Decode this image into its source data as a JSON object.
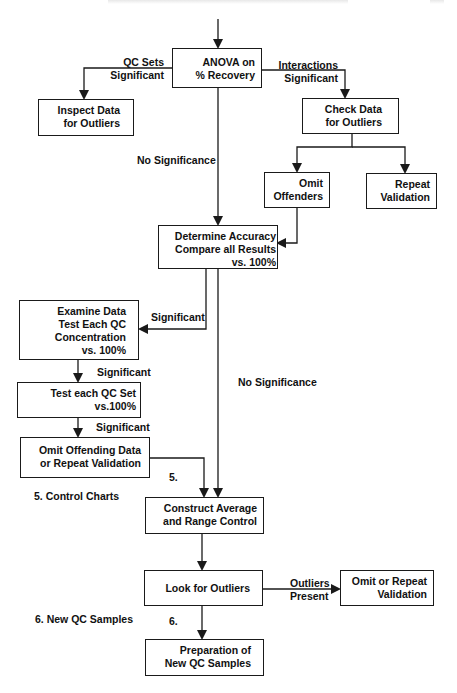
{
  "diagram": {
    "type": "flowchart",
    "nodes": {
      "anova": {
        "lines": [
          "ANOVA on",
          "% Recovery"
        ]
      },
      "inspect": {
        "lines": [
          "Inspect Data",
          "for Outliers"
        ]
      },
      "check": {
        "lines": [
          "Check Data",
          "for Outliers"
        ]
      },
      "omit_offenders": {
        "lines": [
          "Omit",
          "Offenders"
        ]
      },
      "repeat_validation": {
        "lines": [
          "Repeat",
          "Validation"
        ]
      },
      "determine": {
        "lines": [
          "Determine Accuracy",
          "Compare all Results",
          "vs. 100%"
        ]
      },
      "examine": {
        "lines": [
          "Examine Data",
          "Test Each QC",
          "Concentration",
          "vs. 100%"
        ]
      },
      "test_set": {
        "lines": [
          "Test each QC Set",
          "vs.100%"
        ]
      },
      "omit_offending": {
        "lines": [
          "Omit Offending Data",
          "or Repeat Validation"
        ]
      },
      "construct": {
        "lines": [
          "Construct Average",
          "and Range Control"
        ]
      },
      "look": {
        "lines": [
          "Look for Outliers"
        ]
      },
      "omit_repeat": {
        "lines": [
          "Omit or Repeat",
          "Validation"
        ]
      },
      "preparation": {
        "lines": [
          "Preparation of",
          "New QC Samples"
        ]
      }
    },
    "edge_labels": {
      "qc_sets": [
        "QC Sets",
        "Significant"
      ],
      "interactions": [
        "Interactions",
        "Significant"
      ],
      "no_significance_1": [
        "No Significance"
      ],
      "significant_1": [
        "Significant"
      ],
      "no_significance_2": [
        "No Significance"
      ],
      "significant_2": [
        "Significant"
      ],
      "significant_3": [
        "Significant"
      ],
      "step5": [
        "5."
      ],
      "outliers_present": [
        "Outliers",
        "Present"
      ],
      "step6": [
        "6."
      ]
    },
    "section_labels": {
      "control_charts": "5.  Control Charts",
      "new_qc_samples": "6. New QC Samples"
    },
    "edges": [
      {
        "from": "entry",
        "to": "anova"
      },
      {
        "from": "anova",
        "to": "inspect",
        "label": "QC Sets Significant"
      },
      {
        "from": "anova",
        "to": "check",
        "label": "Interactions Significant"
      },
      {
        "from": "anova",
        "to": "determine",
        "label": "No Significance"
      },
      {
        "from": "check",
        "to": "omit_offenders"
      },
      {
        "from": "check",
        "to": "repeat_validation"
      },
      {
        "from": "omit_offenders",
        "to": "determine"
      },
      {
        "from": "determine",
        "to": "examine",
        "label": "Significant"
      },
      {
        "from": "determine",
        "to": "construct",
        "label": "No Significance"
      },
      {
        "from": "examine",
        "to": "test_set",
        "label": "Significant"
      },
      {
        "from": "test_set",
        "to": "omit_offending",
        "label": "Significant"
      },
      {
        "from": "omit_offending",
        "to": "construct",
        "label": "5."
      },
      {
        "from": "construct",
        "to": "look"
      },
      {
        "from": "look",
        "to": "omit_repeat",
        "label": "Outliers Present"
      },
      {
        "from": "look",
        "to": "preparation",
        "label": "6."
      }
    ],
    "colors": {
      "line": "#1a1a1a",
      "background": "#ffffff"
    }
  }
}
